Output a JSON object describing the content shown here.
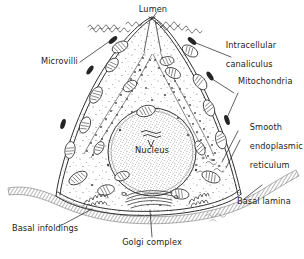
{
  "figure": {
    "type": "cell-diagram",
    "style": "pen-and-ink line drawing with stipple shading",
    "background_color": "#ffffff",
    "ink_color": "#2b2b2b",
    "signature": "Kenney"
  },
  "labels": {
    "lumen": "Lumen",
    "intracellular_canaliculus": "Intracellular\ncanaliculus",
    "intracellular_canaliculus_line1": "Intracellular",
    "intracellular_canaliculus_line2": "canaliculus",
    "microvilli": "Microvilli",
    "mitochondria": "Mitochondria",
    "smooth_er_line1": "Smooth",
    "smooth_er_line2": "endoplasmic",
    "smooth_er_line3": "reticulum",
    "basal_lamina": "Basal lamina",
    "basal_infoldings": "Basal infoldings",
    "golgi_complex": "Golgi complex",
    "nucleus": "Nucleus"
  },
  "structures": [
    {
      "name": "lumen",
      "label": "Lumen",
      "position": "apex, central cleft"
    },
    {
      "name": "intracellular-canaliculus",
      "label": "Intracellular canaliculus",
      "position": "upper right membrane invagination"
    },
    {
      "name": "microvilli",
      "label": "Microvilli",
      "position": "apical surface and canaliculi lining"
    },
    {
      "name": "mitochondria",
      "label": "Mitochondria",
      "position": "distributed throughout cytoplasm"
    },
    {
      "name": "smooth-endoplasmic-reticulum",
      "label": "Smooth endoplasmic reticulum",
      "position": "right cytoplasm"
    },
    {
      "name": "basal-lamina",
      "label": "Basal lamina",
      "position": "beneath basal cell surface"
    },
    {
      "name": "basal-infoldings",
      "label": "Basal infoldings",
      "position": "basal membrane, left and right"
    },
    {
      "name": "golgi-complex",
      "label": "Golgi complex",
      "position": "below nucleus, basal cytoplasm"
    },
    {
      "name": "nucleus",
      "label": "Nucleus",
      "position": "cell center"
    }
  ]
}
